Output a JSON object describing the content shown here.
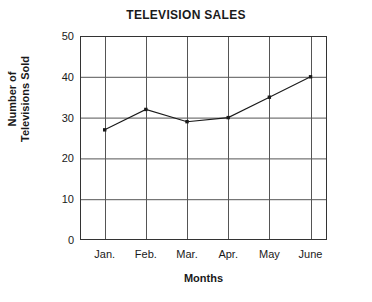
{
  "chart_data": {
    "type": "line",
    "title": "TELEVISION SALES",
    "xlabel": "Months",
    "ylabel": "Number of Televisions Sold",
    "ylabel_lines": [
      "Number of",
      "Televisions Sold"
    ],
    "categories": [
      "Jan.",
      "Feb.",
      "Mar.",
      "Apr.",
      "May",
      "June"
    ],
    "values": [
      27,
      32,
      29,
      30,
      35,
      40
    ],
    "series": [
      {
        "name": "Number of Televisions Sold",
        "values": [
          27,
          32,
          29,
          30,
          35,
          40
        ]
      }
    ],
    "ylim": [
      0,
      50
    ],
    "yticks": [
      0,
      10,
      20,
      30,
      40,
      50
    ],
    "ytick_labels": [
      "0",
      "10",
      "20",
      "30",
      "40",
      "50"
    ],
    "grid": true,
    "grid_x": true,
    "grid_y": true,
    "legend": false,
    "legend_position": "none",
    "marker": "square",
    "line_color": "#1a1a1a",
    "marker_color": "#1a1a1a",
    "grid_color": "#555555",
    "axis_color": "#333333",
    "background_color": "#ffffff"
  }
}
